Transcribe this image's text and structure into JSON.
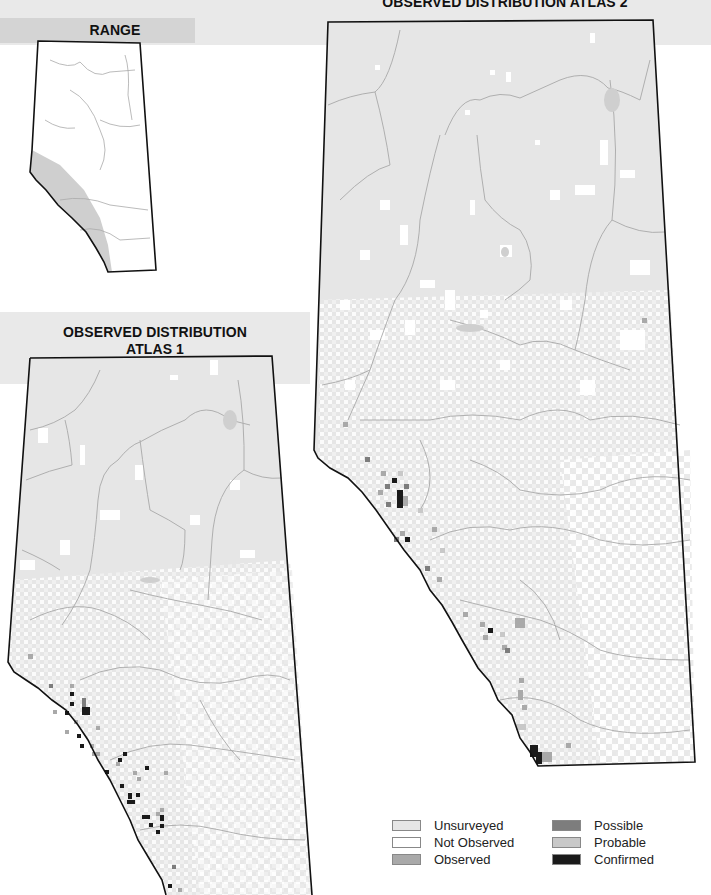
{
  "panels": {
    "range": {
      "title": "RANGE"
    },
    "atlas1": {
      "title_line1": "OBSERVED DISTRIBUTION",
      "title_line2": "ATLAS 1"
    },
    "atlas2": {
      "title": "OBSERVED DISTRIBUTION ATLAS 2"
    }
  },
  "legend": {
    "items": [
      {
        "label": "Unsurveyed",
        "color": "#e6e6e6"
      },
      {
        "label": "Not Observed",
        "color": "#ffffff"
      },
      {
        "label": "Observed",
        "color": "#a9a9a9"
      },
      {
        "label": "Possible",
        "color": "#7d7d7d"
      },
      {
        "label": "Probable",
        "color": "#c8c8c8"
      },
      {
        "label": "Confirmed",
        "color": "#1a1a1a"
      }
    ]
  },
  "colors": {
    "band": "#e9e9e9",
    "range_band": "#d4d4d4",
    "unsurveyed": "#e6e6e6",
    "range_shade": "#cfcfcf",
    "border": "#111111",
    "river": "#a8a8a8"
  }
}
